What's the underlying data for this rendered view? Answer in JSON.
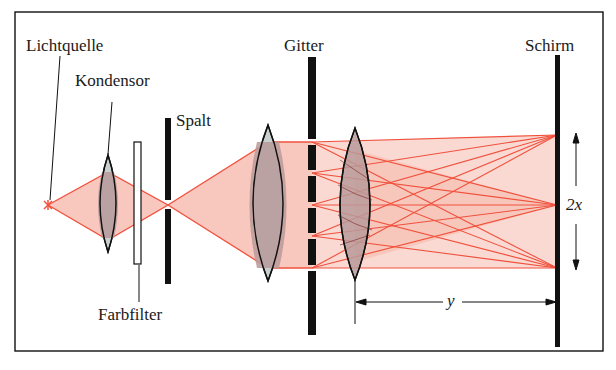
{
  "diagram": {
    "type": "optical-setup",
    "labels": {
      "light_source": "Lichtquelle",
      "condenser": "Kondensor",
      "slit": "Spalt",
      "color_filter": "Farbfilter",
      "grating": "Gitter",
      "screen": "Schirm",
      "distance_x": "2x",
      "distance_y": "y"
    },
    "colors": {
      "beam_line": "#f0503c",
      "beam_fill": "#f6b9ad",
      "lens_fill": "#b89a9a",
      "lens_tip": "#c8cfcf",
      "ink": "#111111"
    },
    "components": [
      {
        "id": "light_source",
        "x": 48,
        "y": 205
      },
      {
        "id": "condenser",
        "x": 108,
        "y_top": 155,
        "y_bottom": 252
      },
      {
        "id": "color_filter",
        "x": 137,
        "y_top": 142,
        "y_bottom": 264
      },
      {
        "id": "slit",
        "x": 168,
        "y_top": 118,
        "y_bottom": 284
      },
      {
        "id": "lens_1",
        "x": 268,
        "y_top": 125,
        "y_bottom": 281
      },
      {
        "id": "grating",
        "x": 312,
        "y_top": 57,
        "y_bottom": 335,
        "slit_positions": [
          142,
          173,
          205,
          236,
          268
        ]
      },
      {
        "id": "lens_2",
        "x": 355,
        "y_top": 128,
        "y_bottom": 280
      },
      {
        "id": "screen",
        "x": 557,
        "y_top": 55,
        "y_bottom": 347,
        "orders": [
          135,
          205,
          268
        ]
      }
    ]
  }
}
